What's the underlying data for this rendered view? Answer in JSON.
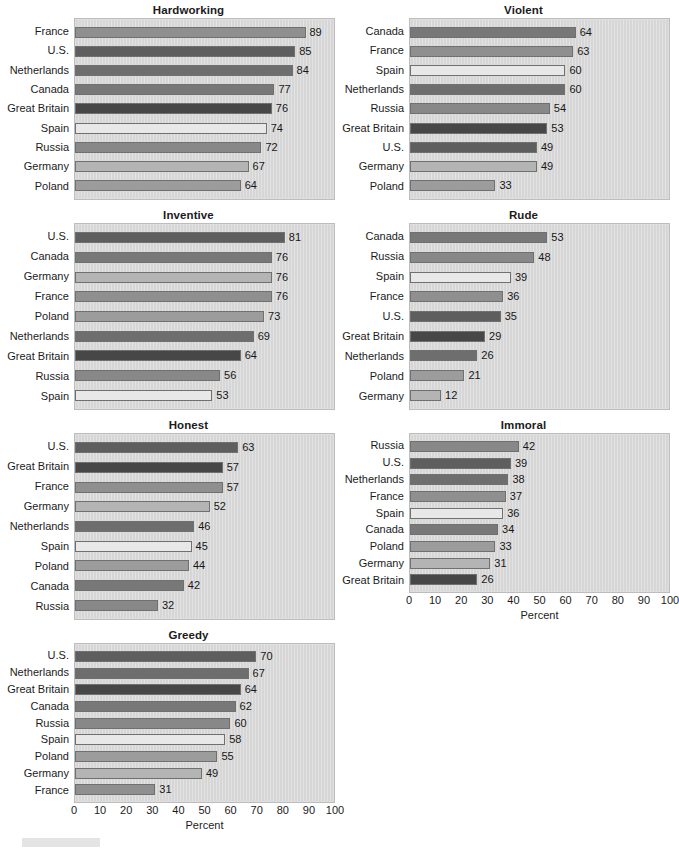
{
  "figure": {
    "axis_title": "Percent",
    "xlim": [
      0,
      100
    ],
    "ticks": [
      "0",
      "10",
      "20",
      "30",
      "40",
      "50",
      "60",
      "70",
      "80",
      "90",
      "100"
    ],
    "country_colors": {
      "France": "#8f8f8f",
      "U.S.": "#5e5e5e",
      "Netherlands": "#6e6e6e",
      "Canada": "#787878",
      "Great Britain": "#474747",
      "Spain": "#e8e8e8",
      "Russia": "#888888",
      "Germany": "#b4b4b4",
      "Poland": "#9c9c9c"
    }
  },
  "chart_data": [
    {
      "type": "bar",
      "title": "Hardworking",
      "xlabel": "Percent",
      "ylabel": "",
      "xlim": [
        0,
        100
      ],
      "orientation": "horizontal",
      "grid": false,
      "legend": "none",
      "categories": [
        "France",
        "U.S.",
        "Netherlands",
        "Canada",
        "Great Britain",
        "Spain",
        "Russia",
        "Germany",
        "Poland"
      ],
      "values": [
        89,
        85,
        84,
        77,
        76,
        74,
        72,
        67,
        64
      ]
    },
    {
      "type": "bar",
      "title": "Violent",
      "xlabel": "Percent",
      "ylabel": "",
      "xlim": [
        0,
        100
      ],
      "orientation": "horizontal",
      "grid": false,
      "legend": "none",
      "categories": [
        "Canada",
        "France",
        "Spain",
        "Netherlands",
        "Russia",
        "Great Britain",
        "U.S.",
        "Germany",
        "Poland"
      ],
      "values": [
        64,
        63,
        60,
        60,
        54,
        53,
        49,
        49,
        33
      ]
    },
    {
      "type": "bar",
      "title": "Inventive",
      "xlabel": "Percent",
      "ylabel": "",
      "xlim": [
        0,
        100
      ],
      "orientation": "horizontal",
      "grid": false,
      "legend": "none",
      "categories": [
        "U.S.",
        "Canada",
        "Germany",
        "France",
        "Poland",
        "Netherlands",
        "Great Britain",
        "Russia",
        "Spain"
      ],
      "values": [
        81,
        76,
        76,
        76,
        73,
        69,
        64,
        56,
        53
      ]
    },
    {
      "type": "bar",
      "title": "Rude",
      "xlabel": "Percent",
      "ylabel": "",
      "xlim": [
        0,
        100
      ],
      "orientation": "horizontal",
      "grid": false,
      "legend": "none",
      "categories": [
        "Canada",
        "Russia",
        "Spain",
        "France",
        "U.S.",
        "Great Britain",
        "Netherlands",
        "Poland",
        "Germany"
      ],
      "values": [
        53,
        48,
        39,
        36,
        35,
        29,
        26,
        21,
        12
      ]
    },
    {
      "type": "bar",
      "title": "Honest",
      "xlabel": "Percent",
      "ylabel": "",
      "xlim": [
        0,
        100
      ],
      "orientation": "horizontal",
      "grid": false,
      "legend": "none",
      "categories": [
        "U.S.",
        "Great Britain",
        "France",
        "Germany",
        "Netherlands",
        "Spain",
        "Poland",
        "Canada",
        "Russia"
      ],
      "values": [
        63,
        57,
        57,
        52,
        46,
        45,
        44,
        42,
        32
      ]
    },
    {
      "type": "bar",
      "title": "Immoral",
      "xlabel": "Percent",
      "ylabel": "",
      "xlim": [
        0,
        100
      ],
      "orientation": "horizontal",
      "grid": false,
      "legend": "none",
      "categories": [
        "Russia",
        "U.S.",
        "Netherlands",
        "France",
        "Spain",
        "Canada",
        "Poland",
        "Germany",
        "Great Britain"
      ],
      "values": [
        42,
        39,
        38,
        37,
        36,
        34,
        33,
        31,
        26
      ]
    },
    {
      "type": "bar",
      "title": "Greedy",
      "xlabel": "Percent",
      "ylabel": "",
      "xlim": [
        0,
        100
      ],
      "orientation": "horizontal",
      "grid": false,
      "legend": "none",
      "categories": [
        "U.S.",
        "Netherlands",
        "Great Britain",
        "Canada",
        "Russia",
        "Spain",
        "Poland",
        "Germany",
        "France"
      ],
      "values": [
        70,
        67,
        64,
        62,
        60,
        55,
        49,
        31
      ]
    }
  ]
}
